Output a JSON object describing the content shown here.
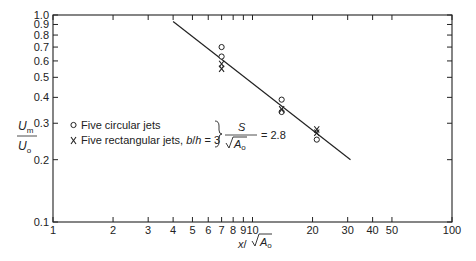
{
  "chart_data": {
    "type": "scatter",
    "title": "",
    "xscale": "log",
    "yscale": "log",
    "xlim": [
      1,
      100
    ],
    "ylim": [
      0.1,
      1.0
    ],
    "xlabel": "x/√A₀",
    "ylabel": "U_m / U_o",
    "grid": false,
    "x_ticks": [
      1,
      2,
      3,
      4,
      5,
      6,
      7,
      8,
      9,
      10,
      20,
      30,
      40,
      50,
      100
    ],
    "x_tick_labels": [
      "1",
      "2",
      "3",
      "4",
      "5",
      "6",
      "7",
      "8",
      "9",
      "10",
      "20",
      "30",
      "40",
      "50",
      "100"
    ],
    "y_ticks": [
      0.1,
      0.2,
      0.3,
      0.4,
      0.5,
      0.6,
      0.7,
      0.8,
      0.9,
      1.0
    ],
    "y_tick_labels": [
      "0.1",
      "0.2",
      "0.3",
      "0.4",
      "0.5",
      "0.6",
      "0.7",
      "0.8",
      "0.9",
      "1.0"
    ],
    "series": [
      {
        "name": "Five circular jets",
        "marker": "o",
        "points": [
          [
            7,
            0.7
          ],
          [
            7,
            0.63
          ],
          [
            14,
            0.39
          ],
          [
            14,
            0.34
          ],
          [
            21,
            0.25
          ]
        ]
      },
      {
        "name": "Five rectangular jets, b/h = 3",
        "marker": "x",
        "points": [
          [
            7,
            0.58
          ],
          [
            7,
            0.55
          ],
          [
            14,
            0.35
          ],
          [
            21,
            0.28
          ],
          [
            21,
            0.27
          ]
        ]
      },
      {
        "name": "fit line",
        "marker": "line",
        "points": [
          [
            4,
            0.93
          ],
          [
            31,
            0.2
          ]
        ]
      }
    ],
    "legend": {
      "position": "center-left",
      "entries": [
        {
          "marker": "o",
          "label": "Five circular jets"
        },
        {
          "marker": "x",
          "label": "Five rectangular jets, b/h = 3"
        }
      ],
      "annotation": "S/√A₀ = 2.8"
    }
  },
  "labels": {
    "ylabel_num": "U",
    "ylabel_num_sub": "m",
    "ylabel_den": "U",
    "ylabel_den_sub": "o",
    "xlabel_x": "x",
    "xlabel_slash": "/",
    "xlabel_A": "A",
    "xlabel_sub": "o",
    "legend_circ": "Five circular jets",
    "legend_rect_a": "Five rectangular jets, ",
    "legend_rect_b": "b",
    "legend_rect_c": "/",
    "legend_rect_d": "h",
    "legend_rect_e": " = 3",
    "anno_S": "S",
    "anno_A": "A",
    "anno_sub": "o",
    "anno_eq": "= 2.8",
    "marker_o": "o",
    "marker_x": "x"
  }
}
